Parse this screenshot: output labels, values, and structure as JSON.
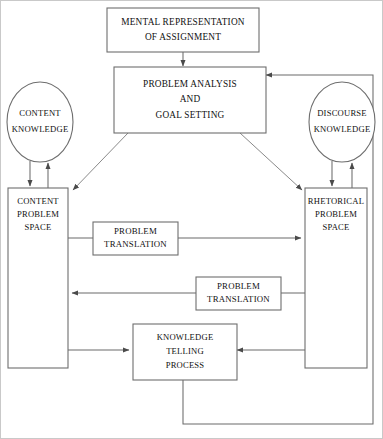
{
  "diagram": {
    "colors": {
      "background": "#ffffff",
      "stroke": "#6e6e6e",
      "edge": "#6b6b6b",
      "text": "#111111",
      "frame": "#c9c9c9"
    },
    "nodes": {
      "mental_representation": {
        "shape": "rectangle",
        "lines": [
          "MENTAL REPRESENTATION",
          "OF ASSIGNMENT"
        ]
      },
      "problem_analysis": {
        "shape": "rectangle",
        "lines": [
          "PROBLEM ANALYSIS",
          "AND",
          "GOAL SETTING"
        ]
      },
      "content_knowledge": {
        "shape": "ellipse",
        "lines": [
          "CONTENT",
          "KNOWLEDGE"
        ]
      },
      "discourse_knowledge": {
        "shape": "ellipse",
        "lines": [
          "DISCOURSE",
          "KNOWLEDGE"
        ]
      },
      "content_problem_space": {
        "shape": "rectangle",
        "lines": [
          "CONTENT",
          "PROBLEM",
          "SPACE"
        ]
      },
      "rhetorical_problem_space": {
        "shape": "rectangle",
        "lines": [
          "RHETORICAL",
          "PROBLEM",
          "SPACE"
        ]
      },
      "problem_translation_upper": {
        "shape": "rectangle",
        "lines": [
          "PROBLEM",
          "TRANSLATION"
        ]
      },
      "problem_translation_lower": {
        "shape": "rectangle",
        "lines": [
          "PROBLEM",
          "TRANSLATION"
        ]
      },
      "knowledge_telling_process": {
        "shape": "rectangle",
        "lines": [
          "KNOWLEDGE",
          "TELLING",
          "PROCESS"
        ]
      }
    },
    "edges": [
      {
        "from": "mental_representation",
        "to": "problem_analysis",
        "arrow": "down"
      },
      {
        "from": "content_knowledge",
        "to": "content_problem_space",
        "arrow": "down"
      },
      {
        "from": "content_problem_space",
        "to": "content_knowledge",
        "arrow": "up"
      },
      {
        "from": "discourse_knowledge",
        "to": "rhetorical_problem_space",
        "arrow": "down"
      },
      {
        "from": "rhetorical_problem_space",
        "to": "discourse_knowledge",
        "arrow": "up"
      },
      {
        "from": "problem_analysis",
        "to": "content_problem_space",
        "arrow": "diagonal-left"
      },
      {
        "from": "problem_analysis",
        "to": "rhetorical_problem_space",
        "arrow": "diagonal-right"
      },
      {
        "from": "content_problem_space",
        "to": "rhetorical_problem_space",
        "arrow": "right",
        "label": "problem_translation_upper"
      },
      {
        "from": "rhetorical_problem_space",
        "to": "content_problem_space",
        "arrow": "left",
        "label": "problem_translation_lower"
      },
      {
        "from": "content_problem_space",
        "to": "knowledge_telling_process",
        "arrow": "right"
      },
      {
        "from": "rhetorical_problem_space",
        "to": "knowledge_telling_process",
        "arrow": "left"
      },
      {
        "from": "knowledge_telling_process",
        "to": "problem_analysis",
        "arrow": "feedback-loop"
      }
    ]
  }
}
